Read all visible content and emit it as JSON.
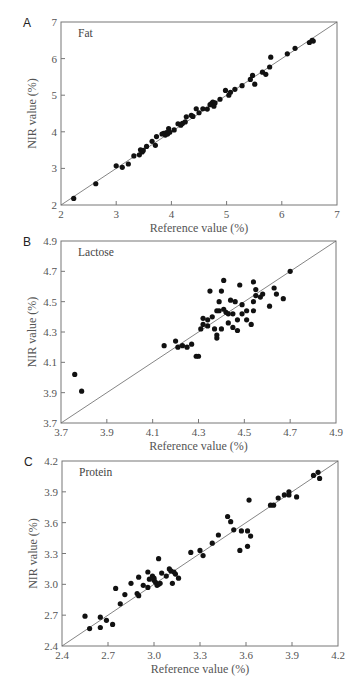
{
  "chart_data": [
    {
      "type": "scatter",
      "panel": "A",
      "title": "Fat",
      "xlabel": "Reference value (%)",
      "ylabel": "NIR value (%)",
      "xlim": [
        2,
        7
      ],
      "ylim": [
        2,
        7
      ],
      "xticks": [
        "2",
        "3",
        "4",
        "5",
        "6",
        "7"
      ],
      "yticks": [
        "2",
        "3",
        "4",
        "5",
        "6",
        "7"
      ],
      "reference_line": "y = x",
      "grid": false,
      "points": [
        [
          2.23,
          2.18
        ],
        [
          2.63,
          2.58
        ],
        [
          3.0,
          3.07
        ],
        [
          3.11,
          3.03
        ],
        [
          3.22,
          3.12
        ],
        [
          3.32,
          3.34
        ],
        [
          3.42,
          3.37
        ],
        [
          3.44,
          3.51
        ],
        [
          3.47,
          3.45
        ],
        [
          3.49,
          3.49
        ],
        [
          3.55,
          3.6
        ],
        [
          3.65,
          3.74
        ],
        [
          3.71,
          3.63
        ],
        [
          3.73,
          3.87
        ],
        [
          3.83,
          3.94
        ],
        [
          3.86,
          3.96
        ],
        [
          3.89,
          3.91
        ],
        [
          3.91,
          3.98
        ],
        [
          3.93,
          3.94
        ],
        [
          3.95,
          4.09
        ],
        [
          3.97,
          3.99
        ],
        [
          4.05,
          4.05
        ],
        [
          4.12,
          4.22
        ],
        [
          4.17,
          4.18
        ],
        [
          4.2,
          4.23
        ],
        [
          4.25,
          4.27
        ],
        [
          4.27,
          4.41
        ],
        [
          4.36,
          4.45
        ],
        [
          4.39,
          4.42
        ],
        [
          4.45,
          4.63
        ],
        [
          4.5,
          4.52
        ],
        [
          4.57,
          4.63
        ],
        [
          4.65,
          4.62
        ],
        [
          4.7,
          4.74
        ],
        [
          4.73,
          4.78
        ],
        [
          4.75,
          4.81
        ],
        [
          4.77,
          4.7
        ],
        [
          4.79,
          4.79
        ],
        [
          4.88,
          4.89
        ],
        [
          4.98,
          5.13
        ],
        [
          5.04,
          5.0
        ],
        [
          5.07,
          5.08
        ],
        [
          5.15,
          5.16
        ],
        [
          5.28,
          5.26
        ],
        [
          5.43,
          5.43
        ],
        [
          5.47,
          5.54
        ],
        [
          5.51,
          5.3
        ],
        [
          5.65,
          5.63
        ],
        [
          5.71,
          5.57
        ],
        [
          5.78,
          5.77
        ],
        [
          5.8,
          6.04
        ],
        [
          6.1,
          6.13
        ],
        [
          6.24,
          6.28
        ],
        [
          6.5,
          6.44
        ],
        [
          6.55,
          6.5
        ],
        [
          6.57,
          6.48
        ]
      ]
    },
    {
      "type": "scatter",
      "panel": "B",
      "title": "Lactose",
      "xlabel": "Reference value (%)",
      "ylabel": "NIR value (%)",
      "xlim": [
        3.7,
        4.9
      ],
      "ylim": [
        3.7,
        4.9
      ],
      "xticks": [
        "3.7",
        "3.9",
        "4.1",
        "4.3",
        "4.5",
        "4.7",
        "4.9"
      ],
      "yticks": [
        "3.7",
        "3.9",
        "4.1",
        "4.3",
        "4.5",
        "4.7",
        "4.9"
      ],
      "reference_line": "y = x",
      "grid": false,
      "points": [
        [
          3.76,
          4.02
        ],
        [
          3.79,
          3.91
        ],
        [
          4.15,
          4.21
        ],
        [
          4.2,
          4.24
        ],
        [
          4.21,
          4.2
        ],
        [
          4.23,
          4.21
        ],
        [
          4.25,
          4.2
        ],
        [
          4.27,
          4.22
        ],
        [
          4.29,
          4.14
        ],
        [
          4.3,
          4.14
        ],
        [
          4.31,
          4.32
        ],
        [
          4.32,
          4.35
        ],
        [
          4.32,
          4.39
        ],
        [
          4.34,
          4.38
        ],
        [
          4.34,
          4.34
        ],
        [
          4.35,
          4.57
        ],
        [
          4.36,
          4.4
        ],
        [
          4.37,
          4.32
        ],
        [
          4.38,
          4.44
        ],
        [
          4.38,
          4.28
        ],
        [
          4.38,
          4.26
        ],
        [
          4.39,
          4.5
        ],
        [
          4.39,
          4.44
        ],
        [
          4.4,
          4.57
        ],
        [
          4.4,
          4.32
        ],
        [
          4.41,
          4.45
        ],
        [
          4.41,
          4.64
        ],
        [
          4.42,
          4.43
        ],
        [
          4.43,
          4.42
        ],
        [
          4.43,
          4.36
        ],
        [
          4.44,
          4.51
        ],
        [
          4.45,
          4.42
        ],
        [
          4.45,
          4.33
        ],
        [
          4.46,
          4.5
        ],
        [
          4.47,
          4.38
        ],
        [
          4.47,
          4.31
        ],
        [
          4.48,
          4.61
        ],
        [
          4.49,
          4.48
        ],
        [
          4.49,
          4.42
        ],
        [
          4.51,
          4.44
        ],
        [
          4.51,
          4.38
        ],
        [
          4.53,
          4.35
        ],
        [
          4.54,
          4.63
        ],
        [
          4.54,
          4.5
        ],
        [
          4.54,
          4.44
        ],
        [
          4.55,
          4.54
        ],
        [
          4.55,
          4.58
        ],
        [
          4.57,
          4.53
        ],
        [
          4.58,
          4.55
        ],
        [
          4.61,
          4.47
        ],
        [
          4.63,
          4.59
        ],
        [
          4.64,
          4.55
        ],
        [
          4.67,
          4.52
        ],
        [
          4.7,
          4.7
        ]
      ]
    },
    {
      "type": "scatter",
      "panel": "C",
      "title": "Protein",
      "xlabel": "Reference value (%)",
      "ylabel": "NIR value (%)",
      "xlim": [
        2.4,
        4.2
      ],
      "ylim": [
        2.4,
        4.2
      ],
      "xticks": [
        "2.4",
        "2.7",
        "3.0",
        "3.3",
        "3.6",
        "3.9",
        "4.2"
      ],
      "yticks": [
        "2.4",
        "2.7",
        "3.0",
        "3.3",
        "3.6",
        "3.9",
        "4.2"
      ],
      "reference_line": "y = x",
      "grid": false,
      "points": [
        [
          2.55,
          2.69
        ],
        [
          2.58,
          2.57
        ],
        [
          2.65,
          2.68
        ],
        [
          2.65,
          2.58
        ],
        [
          2.69,
          2.65
        ],
        [
          2.73,
          2.61
        ],
        [
          2.75,
          2.96
        ],
        [
          2.78,
          2.81
        ],
        [
          2.81,
          2.9
        ],
        [
          2.85,
          3.01
        ],
        [
          2.89,
          2.91
        ],
        [
          2.9,
          2.89
        ],
        [
          2.9,
          3.07
        ],
        [
          2.93,
          2.99
        ],
        [
          2.96,
          3.12
        ],
        [
          2.96,
          2.97
        ],
        [
          2.97,
          3.05
        ],
        [
          2.99,
          3.08
        ],
        [
          3.0,
          3.04
        ],
        [
          3.0,
          3.06
        ],
        [
          3.01,
          3.02
        ],
        [
          3.02,
          2.99
        ],
        [
          3.03,
          3.25
        ],
        [
          3.03,
          3.0
        ],
        [
          3.04,
          3.01
        ],
        [
          3.05,
          3.11
        ],
        [
          3.08,
          3.08
        ],
        [
          3.1,
          3.15
        ],
        [
          3.11,
          3.13
        ],
        [
          3.12,
          3.01
        ],
        [
          3.13,
          3.12
        ],
        [
          3.14,
          3.1
        ],
        [
          3.16,
          3.06
        ],
        [
          3.24,
          3.31
        ],
        [
          3.3,
          3.33
        ],
        [
          3.32,
          3.28
        ],
        [
          3.38,
          3.4
        ],
        [
          3.42,
          3.48
        ],
        [
          3.48,
          3.66
        ],
        [
          3.5,
          3.61
        ],
        [
          3.52,
          3.53
        ],
        [
          3.56,
          3.33
        ],
        [
          3.57,
          3.52
        ],
        [
          3.61,
          3.37
        ],
        [
          3.61,
          3.52
        ],
        [
          3.62,
          3.82
        ],
        [
          3.63,
          3.47
        ],
        [
          3.76,
          3.77
        ],
        [
          3.78,
          3.77
        ],
        [
          3.81,
          3.84
        ],
        [
          3.85,
          3.87
        ],
        [
          3.88,
          3.87
        ],
        [
          3.88,
          3.9
        ],
        [
          3.93,
          3.85
        ],
        [
          4.04,
          4.06
        ],
        [
          4.07,
          4.09
        ],
        [
          4.08,
          4.03
        ]
      ]
    }
  ]
}
